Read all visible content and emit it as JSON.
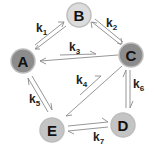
{
  "diagram": {
    "type": "reaction-network",
    "nodes": [
      {
        "id": "A",
        "label": "A",
        "cx": 23,
        "cy": 61,
        "r": 12,
        "fill": "#8c8c8c"
      },
      {
        "id": "B",
        "label": "B",
        "cx": 79,
        "cy": 15,
        "r": 12,
        "fill": "#dcdcdc"
      },
      {
        "id": "C",
        "label": "C",
        "cx": 131,
        "cy": 55,
        "r": 12,
        "fill": "#8c8c8c"
      },
      {
        "id": "D",
        "label": "D",
        "cx": 123,
        "cy": 125,
        "r": 12,
        "fill": "#c4c4c4"
      },
      {
        "id": "E",
        "label": "E",
        "cx": 52,
        "cy": 130,
        "r": 12,
        "fill": "#c4c4c4"
      }
    ],
    "edges": [
      {
        "id": "k1",
        "from": "A",
        "to": "B",
        "reversible": true,
        "label": "k",
        "sub": "1"
      },
      {
        "id": "k2",
        "from": "B",
        "to": "C",
        "reversible": true,
        "label": "k",
        "sub": "2"
      },
      {
        "id": "k3",
        "from": "A",
        "to": "C",
        "reversible": true,
        "label": "k",
        "sub": "3"
      },
      {
        "id": "k4",
        "from": "E",
        "to": "C",
        "reversible": true,
        "label": "k",
        "sub": "4"
      },
      {
        "id": "k5",
        "from": "A",
        "to": "E",
        "reversible": true,
        "label": "k",
        "sub": "5"
      },
      {
        "id": "k6",
        "from": "C",
        "to": "D",
        "reversible": true,
        "label": "k",
        "sub": "6"
      },
      {
        "id": "k7",
        "from": "E",
        "to": "D",
        "reversible": true,
        "label": "k",
        "sub": "7"
      }
    ],
    "labels": {
      "k1": {
        "main": "k",
        "sub": "1"
      },
      "k2": {
        "main": "k",
        "sub": "2"
      },
      "k3": {
        "main": "k",
        "sub": "3"
      },
      "k4": {
        "main": "k",
        "sub": "4"
      },
      "k5": {
        "main": "k",
        "sub": "5"
      },
      "k6": {
        "main": "k",
        "sub": "6"
      },
      "k7": {
        "main": "k",
        "sub": "7"
      }
    },
    "node_labels": {
      "A": "A",
      "B": "B",
      "C": "C",
      "D": "D",
      "E": "E"
    },
    "colors": {
      "edge": "#8a8a8a",
      "node_stroke": "#bdbdbd",
      "text": "#111111"
    }
  }
}
